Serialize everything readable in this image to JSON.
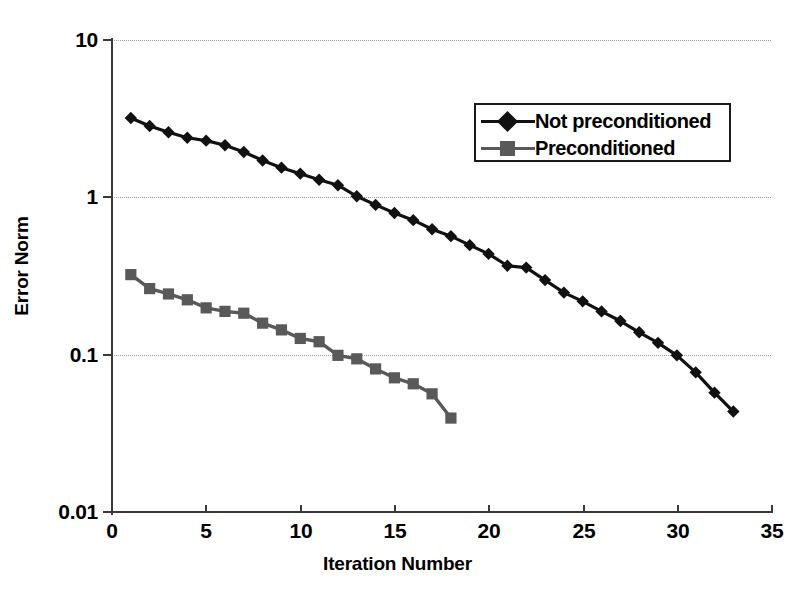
{
  "chart_data": {
    "type": "line",
    "title": "",
    "xlabel": "Iteration Number",
    "ylabel": "Error Norm",
    "xlim": [
      0,
      35
    ],
    "ylim": [
      0.01,
      10
    ],
    "yscale": "log",
    "xticks": [
      0,
      5,
      10,
      15,
      20,
      25,
      30,
      35
    ],
    "xticklabels": [
      "0",
      "5",
      "10",
      "15",
      "20",
      "25",
      "30",
      "35"
    ],
    "yticks": [
      0.01,
      0.1,
      1,
      10
    ],
    "yticklabels": [
      "0.01",
      "0.1",
      "1",
      "10"
    ],
    "grid": "horizontal-dotted",
    "legend_position": "upper-right-inside",
    "series": [
      {
        "name": "Not preconditioned",
        "color": "#111111",
        "marker": "diamond",
        "x": [
          1,
          2,
          3,
          4,
          5,
          6,
          7,
          8,
          9,
          10,
          11,
          12,
          13,
          14,
          15,
          16,
          17,
          18,
          19,
          20,
          21,
          22,
          23,
          24,
          25,
          26,
          27,
          28,
          29,
          30,
          31,
          32,
          33
        ],
        "y": [
          3.2,
          2.85,
          2.6,
          2.4,
          2.3,
          2.15,
          1.95,
          1.72,
          1.55,
          1.42,
          1.3,
          1.2,
          1.02,
          0.9,
          0.8,
          0.72,
          0.63,
          0.57,
          0.5,
          0.44,
          0.37,
          0.36,
          0.3,
          0.25,
          0.22,
          0.19,
          0.165,
          0.14,
          0.12,
          0.1,
          0.078,
          0.058,
          0.044
        ]
      },
      {
        "name": "Preconditioned",
        "color": "#595959",
        "marker": "square",
        "x": [
          1,
          2,
          3,
          4,
          5,
          6,
          7,
          8,
          9,
          10,
          11,
          12,
          13,
          14,
          15,
          16,
          17,
          18
        ],
        "y": [
          0.325,
          0.265,
          0.245,
          0.225,
          0.2,
          0.19,
          0.185,
          0.16,
          0.145,
          0.128,
          0.122,
          0.1,
          0.095,
          0.082,
          0.072,
          0.066,
          0.057,
          0.04
        ]
      }
    ]
  },
  "legend": {
    "items": [
      {
        "label": "Not preconditioned",
        "color": "#111111",
        "marker": "diamond"
      },
      {
        "label": "Preconditioned",
        "color": "#595959",
        "marker": "square"
      }
    ]
  },
  "axes": {
    "x_title": "Iteration Number",
    "y_title": "Error Norm",
    "x_ticklabels": [
      "0",
      "5",
      "10",
      "15",
      "20",
      "25",
      "30",
      "35"
    ],
    "y_ticklabels": [
      "10",
      "1",
      "0.1",
      "0.01"
    ]
  }
}
